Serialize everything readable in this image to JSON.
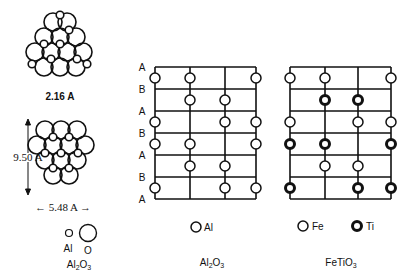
{
  "left_panel": {
    "top_caption": "2.16 A",
    "height_dim": "9.50 A",
    "width_dim": "← 5.48 A →",
    "legend": {
      "small_label": "Al",
      "large_label": "O"
    },
    "formula": "Al₂O₃"
  },
  "middle_panel": {
    "layer_labels": [
      "A",
      "B",
      "A",
      "B",
      "A",
      "B",
      "A"
    ],
    "legend_label": "Al",
    "formula": "Al₂O₃",
    "sites": [
      [
        0,
        1,
        3
      ],
      [
        1,
        2
      ],
      [
        0,
        2,
        3
      ],
      [
        0,
        1,
        3
      ],
      [
        1,
        2
      ],
      [
        0,
        2,
        3
      ]
    ]
  },
  "right_panel": {
    "legend": {
      "fe_label": "Fe",
      "ti_label": "Ti"
    },
    "formula": "FeTiO₃",
    "sites": [
      {
        "type": "Fe",
        "cols": [
          0,
          1,
          3
        ]
      },
      {
        "type": "Ti",
        "cols": [
          1,
          2
        ]
      },
      {
        "type": "Fe",
        "cols": [
          0,
          2,
          3
        ]
      },
      {
        "type": "Ti",
        "cols": [
          0,
          1,
          3
        ]
      },
      {
        "type": "Fe",
        "cols": [
          1,
          2
        ]
      },
      {
        "type": "Ti",
        "cols": [
          0,
          2,
          3
        ]
      }
    ]
  }
}
